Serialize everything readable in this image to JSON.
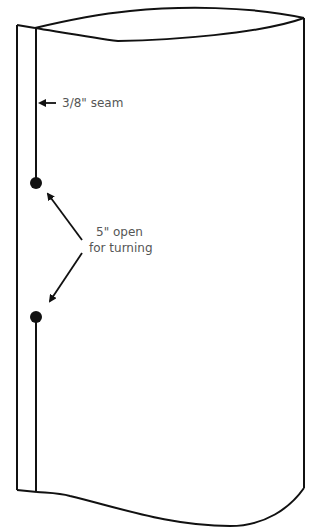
{
  "diagram": {
    "colors": {
      "stroke": "#111111",
      "label_text": "#555555",
      "background": "#ffffff"
    },
    "labels": {
      "seam": "3/8\" seam",
      "opening_line1": "5\" open",
      "opening_line2": "for turning"
    },
    "markers": [
      {
        "name": "opening-start-dot",
        "x": 36,
        "y": 183
      },
      {
        "name": "opening-end-dot",
        "x": 36,
        "y": 317
      }
    ]
  }
}
